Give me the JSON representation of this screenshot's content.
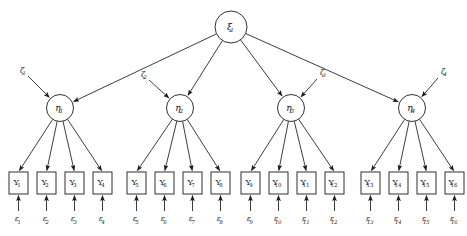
{
  "diagram": {
    "type": "structural-equation-model-path-diagram",
    "title": "",
    "background_color": "#ffffff",
    "line_color": "#1a1a1a",
    "shape_fill": "#ffffff",
    "latent_exogenous": {
      "id": "xi1",
      "glyph": "ξ",
      "subscript": "1",
      "shape": "circle",
      "cx": 231,
      "cy": 27,
      "r": 16
    },
    "latent_endogenous": [
      {
        "id": "eta1",
        "glyph": "η",
        "subscript": "1",
        "shape": "circle",
        "cx": 60,
        "cy": 108,
        "r": 13.5
      },
      {
        "id": "eta2",
        "glyph": "η",
        "subscript": "2",
        "shape": "circle",
        "cx": 180,
        "cy": 108,
        "r": 13.5
      },
      {
        "id": "eta3",
        "glyph": "η",
        "subscript": "3",
        "shape": "circle",
        "cx": 291,
        "cy": 108,
        "r": 13.5
      },
      {
        "id": "eta4",
        "glyph": "η",
        "subscript": "4",
        "shape": "circle",
        "cx": 412,
        "cy": 108,
        "r": 13.5
      }
    ],
    "disturbances": [
      {
        "id": "zeta1",
        "glyph": "ζ",
        "subscript": "1",
        "x": 22,
        "y": 71,
        "target": "eta1",
        "arrow_from": [
          28,
          76
        ],
        "arrow_to": [
          50,
          98
        ]
      },
      {
        "id": "zeta2",
        "glyph": "ζ",
        "subscript": "2",
        "x": 143,
        "y": 75,
        "target": "eta2",
        "arrow_from": [
          149,
          80
        ],
        "arrow_to": [
          170,
          98
        ]
      },
      {
        "id": "zeta3",
        "glyph": "ζ",
        "subscript": "3",
        "x": 322,
        "y": 73,
        "target": "eta3",
        "arrow_from": [
          317,
          79
        ],
        "arrow_to": [
          300,
          98
        ]
      },
      {
        "id": "zeta4",
        "glyph": "ζ",
        "subscript": "4",
        "x": 443,
        "y": 72,
        "target": "eta4",
        "arrow_from": [
          438,
          78
        ],
        "arrow_to": [
          421,
          98
        ]
      }
    ],
    "indicators": [
      {
        "id": "Y1",
        "glyph": "Y",
        "subscript": "1",
        "x": 9,
        "y": 172,
        "w": 19,
        "h": 22,
        "parent": "eta1"
      },
      {
        "id": "Y2",
        "glyph": "Y",
        "subscript": "2",
        "x": 37,
        "y": 172,
        "w": 19,
        "h": 22,
        "parent": "eta1"
      },
      {
        "id": "Y3",
        "glyph": "Y",
        "subscript": "3",
        "x": 65,
        "y": 172,
        "w": 19,
        "h": 22,
        "parent": "eta1"
      },
      {
        "id": "Y4",
        "glyph": "Y",
        "subscript": "4",
        "x": 93,
        "y": 172,
        "w": 19,
        "h": 22,
        "parent": "eta1"
      },
      {
        "id": "Y5",
        "glyph": "Y",
        "subscript": "5",
        "x": 127,
        "y": 172,
        "w": 19,
        "h": 22,
        "parent": "eta2"
      },
      {
        "id": "Y6",
        "glyph": "Y",
        "subscript": "6",
        "x": 155,
        "y": 172,
        "w": 19,
        "h": 22,
        "parent": "eta2"
      },
      {
        "id": "Y7",
        "glyph": "Y",
        "subscript": "7",
        "x": 183,
        "y": 172,
        "w": 19,
        "h": 22,
        "parent": "eta2"
      },
      {
        "id": "Y8",
        "glyph": "Y",
        "subscript": "8",
        "x": 211,
        "y": 172,
        "w": 19,
        "h": 22,
        "parent": "eta2"
      },
      {
        "id": "Y9",
        "glyph": "Y",
        "subscript": "9",
        "x": 241,
        "y": 172,
        "w": 19,
        "h": 22,
        "parent": "eta3"
      },
      {
        "id": "Y10",
        "glyph": "Y",
        "subscript": "10",
        "x": 269,
        "y": 172,
        "w": 19,
        "h": 22,
        "parent": "eta3"
      },
      {
        "id": "Y11",
        "glyph": "Y",
        "subscript": "11",
        "x": 297,
        "y": 172,
        "w": 19,
        "h": 22,
        "parent": "eta3"
      },
      {
        "id": "Y12",
        "glyph": "Y",
        "subscript": "12",
        "x": 325,
        "y": 172,
        "w": 19,
        "h": 22,
        "parent": "eta3"
      },
      {
        "id": "Y13",
        "glyph": "Y",
        "subscript": "13",
        "x": 361,
        "y": 172,
        "w": 19,
        "h": 22,
        "parent": "eta4"
      },
      {
        "id": "Y14",
        "glyph": "Y",
        "subscript": "14",
        "x": 389,
        "y": 172,
        "w": 19,
        "h": 22,
        "parent": "eta4"
      },
      {
        "id": "Y15",
        "glyph": "Y",
        "subscript": "15",
        "x": 417,
        "y": 172,
        "w": 19,
        "h": 22,
        "parent": "eta4"
      },
      {
        "id": "Y16",
        "glyph": "Y",
        "subscript": "16",
        "x": 445,
        "y": 172,
        "w": 19,
        "h": 22,
        "parent": "eta4"
      }
    ],
    "errors": [
      {
        "id": "eps1",
        "glyph": "ε",
        "subscript": "1",
        "x": 18.5,
        "y": 219,
        "target": "Y1"
      },
      {
        "id": "eps2",
        "glyph": "ε",
        "subscript": "2",
        "x": 46.5,
        "y": 219,
        "target": "Y2"
      },
      {
        "id": "eps3",
        "glyph": "ε",
        "subscript": "3",
        "x": 74.5,
        "y": 219,
        "target": "Y3"
      },
      {
        "id": "eps4",
        "glyph": "ε",
        "subscript": "4",
        "x": 102.5,
        "y": 219,
        "target": "Y4"
      },
      {
        "id": "eps5",
        "glyph": "ε",
        "subscript": "5",
        "x": 136.5,
        "y": 219,
        "target": "Y5"
      },
      {
        "id": "eps6",
        "glyph": "ε",
        "subscript": "6",
        "x": 164.5,
        "y": 219,
        "target": "Y6"
      },
      {
        "id": "eps7",
        "glyph": "ε",
        "subscript": "7",
        "x": 192.5,
        "y": 219,
        "target": "Y7"
      },
      {
        "id": "eps8",
        "glyph": "ε",
        "subscript": "8",
        "x": 220.5,
        "y": 219,
        "target": "Y8"
      },
      {
        "id": "eps9",
        "glyph": "ε",
        "subscript": "9",
        "x": 250.5,
        "y": 219,
        "target": "Y9"
      },
      {
        "id": "eps10",
        "glyph": "ε",
        "subscript": "10",
        "x": 278.5,
        "y": 219,
        "target": "Y10"
      },
      {
        "id": "eps11",
        "glyph": "ε",
        "subscript": "11",
        "x": 306.5,
        "y": 219,
        "target": "Y11"
      },
      {
        "id": "eps12",
        "glyph": "ε",
        "subscript": "12",
        "x": 334.5,
        "y": 219,
        "target": "Y12"
      },
      {
        "id": "eps13",
        "glyph": "ε",
        "subscript": "13",
        "x": 370.5,
        "y": 219,
        "target": "Y13"
      },
      {
        "id": "eps14",
        "glyph": "ε",
        "subscript": "14",
        "x": 398.5,
        "y": 219,
        "target": "Y14"
      },
      {
        "id": "eps15",
        "glyph": "ε",
        "subscript": "15",
        "x": 426.5,
        "y": 219,
        "target": "Y15"
      },
      {
        "id": "eps16",
        "glyph": "ε",
        "subscript": "16",
        "x": 454.5,
        "y": 219,
        "target": "Y16"
      }
    ],
    "structural_paths": [
      {
        "from": "xi1",
        "to": "eta1"
      },
      {
        "from": "xi1",
        "to": "eta2"
      },
      {
        "from": "xi1",
        "to": "eta3"
      },
      {
        "from": "xi1",
        "to": "eta4"
      }
    ]
  }
}
